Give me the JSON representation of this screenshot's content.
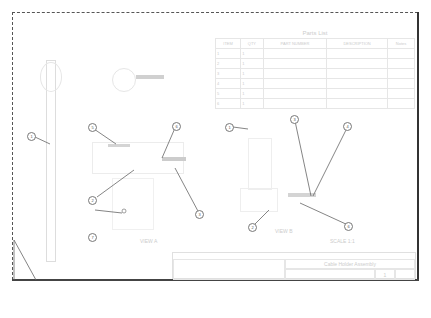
{
  "parts_list": {
    "title": "Parts List",
    "headers": [
      "ITEM",
      "QTY",
      "PART NUMBER",
      "DESCRIPTION",
      "Notes"
    ],
    "rows": [
      [
        "1",
        "1",
        "",
        "",
        ""
      ],
      [
        "2",
        "1",
        "",
        "",
        ""
      ],
      [
        "3",
        "1",
        "",
        "",
        ""
      ],
      [
        "4",
        "1",
        "",
        "",
        ""
      ],
      [
        "5",
        "1",
        "",
        "",
        ""
      ],
      [
        "6",
        "1",
        "",
        "",
        ""
      ]
    ]
  },
  "balloons": [
    "1",
    "5",
    "6",
    "2",
    "3",
    "7",
    "1",
    "3",
    "4",
    "2",
    "6"
  ],
  "views": {
    "view_a_label": "VIEW A",
    "view_b_label": "VIEW B",
    "sheet_note": "SCALE 1:1"
  },
  "title_block": {
    "company": "",
    "title": "Cable Holder Assembly",
    "dwg_no": "",
    "sheet": "1",
    "rev": ""
  }
}
